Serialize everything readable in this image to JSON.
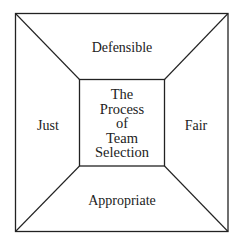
{
  "diagram": {
    "center": {
      "lines": [
        "The",
        "Process",
        "of",
        "Team",
        "Selection"
      ]
    },
    "top": "Defensible",
    "left": "Just",
    "right": "Fair",
    "bottom": "Appropriate",
    "colors": {
      "line": "#222222",
      "background": "#ffffff"
    }
  }
}
